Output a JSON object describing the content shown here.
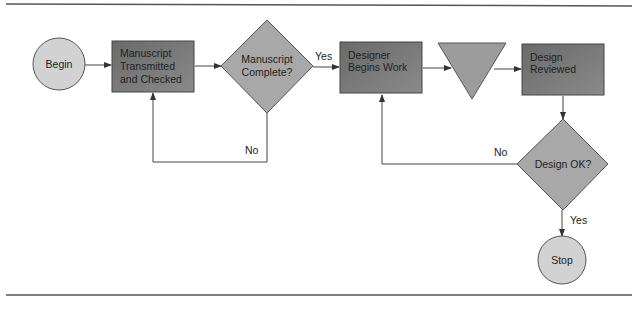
{
  "diagram": {
    "type": "flowchart",
    "nodes": [
      {
        "id": "begin",
        "shape": "circle",
        "label": "Begin"
      },
      {
        "id": "manuscript",
        "shape": "rectangle",
        "lines": [
          "Manuscript",
          "Transmitted",
          "and Checked"
        ]
      },
      {
        "id": "complete",
        "shape": "diamond",
        "lines": [
          "Manuscript",
          "Complete?"
        ]
      },
      {
        "id": "designer",
        "shape": "rectangle",
        "lines": [
          "Designer",
          "Begins Work"
        ]
      },
      {
        "id": "merge",
        "shape": "inverted-triangle",
        "label": ""
      },
      {
        "id": "reviewed",
        "shape": "rectangle",
        "lines": [
          "Design",
          "Reviewed"
        ]
      },
      {
        "id": "ok",
        "shape": "diamond",
        "label": "Design OK?"
      },
      {
        "id": "stop",
        "shape": "circle",
        "label": "Stop"
      }
    ],
    "edges": [
      {
        "from": "begin",
        "to": "manuscript",
        "label": ""
      },
      {
        "from": "manuscript",
        "to": "complete",
        "label": ""
      },
      {
        "from": "complete",
        "to": "designer",
        "label": "Yes"
      },
      {
        "from": "complete",
        "to": "manuscript",
        "label": "No"
      },
      {
        "from": "designer",
        "to": "merge",
        "label": ""
      },
      {
        "from": "merge",
        "to": "reviewed",
        "label": ""
      },
      {
        "from": "reviewed",
        "to": "ok",
        "label": ""
      },
      {
        "from": "ok",
        "to": "designer",
        "label": "No"
      },
      {
        "from": "ok",
        "to": "stop",
        "label": "Yes"
      }
    ],
    "colors": {
      "circle_fill": "#d2d2d2",
      "rect_fill": "#777777",
      "diamond_fill": "#a8a8a8",
      "triangle_fill": "#9c9c9c",
      "line": "#444444",
      "rule": "#555555"
    }
  }
}
